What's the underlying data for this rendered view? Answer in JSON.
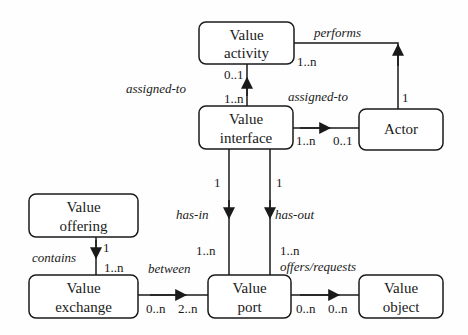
{
  "diagram": {
    "entities": {
      "value_activity": {
        "line1": "Value",
        "line2": "activity"
      },
      "value_interface": {
        "line1": "Value",
        "line2": "interface"
      },
      "actor": {
        "line1": "Actor"
      },
      "value_offering": {
        "line1": "Value",
        "line2": "offering"
      },
      "value_exchange": {
        "line1": "Value",
        "line2": "exchange"
      },
      "value_port": {
        "line1": "Value",
        "line2": "port"
      },
      "value_object": {
        "line1": "Value",
        "line2": "object"
      }
    },
    "relations": {
      "performs": {
        "label": "performs",
        "from_card": "1..n",
        "to_card": "1"
      },
      "interface_to_activity": {
        "label": "assigned-to",
        "from_card": "1..n",
        "to_card": "0..1"
      },
      "interface_to_actor": {
        "label": "assigned-to",
        "from_card": "1..n",
        "to_card": "0..1"
      },
      "has_in": {
        "label": "has-in",
        "from_card": "1",
        "to_card": "1..n"
      },
      "has_out": {
        "label": "has-out",
        "from_card": "1",
        "to_card": "1..n"
      },
      "contains": {
        "label": "contains",
        "from_card": "1",
        "to_card": "1..n"
      },
      "between": {
        "label": "between",
        "from_card": "0..n",
        "to_card": "2..n"
      },
      "offers_requests": {
        "label": "offers/requests",
        "from_card": "0..n",
        "to_card": "0..n"
      }
    },
    "colors": {
      "line": "#1a1a1a",
      "background": "#fefefe"
    }
  }
}
